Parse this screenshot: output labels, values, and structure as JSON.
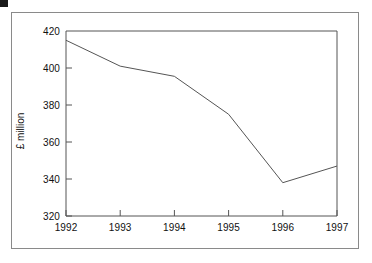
{
  "figure": {
    "background_color": "#ffffff",
    "frame_color": "#8a8a8a",
    "corner_marker_color": "#1a1a1a",
    "line_color": "#555555",
    "axis_color": "#555555",
    "text_color": "#111111"
  },
  "chart_data": {
    "type": "line",
    "title": "",
    "subtitle": "",
    "xlabel": "",
    "ylabel": "£ million",
    "categories": [
      "1992",
      "1993",
      "1994",
      "1995",
      "1996",
      "1997"
    ],
    "x": [
      1992,
      1993,
      1994,
      1995,
      1996,
      1997
    ],
    "values": [
      415,
      401,
      395.5,
      375,
      338,
      347
    ],
    "series": [
      {
        "name": "",
        "values": [
          415,
          401,
          395.5,
          375,
          338,
          347
        ]
      }
    ],
    "xlim": [
      1992,
      1997
    ],
    "ylim": [
      320,
      420
    ],
    "ytick_labels": [
      "320",
      "340",
      "360",
      "380",
      "400",
      "420"
    ],
    "ytick_values": [
      320,
      340,
      360,
      380,
      400,
      420
    ],
    "xtick_labels": [
      "1992",
      "1993",
      "1994",
      "1995",
      "1996",
      "1997"
    ],
    "grid": false,
    "legend": false,
    "legend_position": "none",
    "markers": false,
    "annotations": []
  }
}
